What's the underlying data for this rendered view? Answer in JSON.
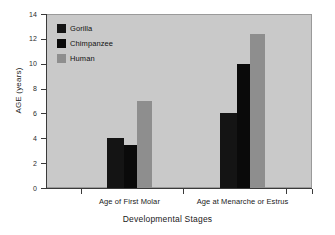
{
  "chart_data": {
    "type": "bar",
    "title": "",
    "xlabel": "Developmental Stages",
    "ylabel": "AGE (years)",
    "categories": [
      "Age of First Molar",
      "Age at Menarche or Estrus"
    ],
    "series": [
      {
        "name": "Gorilla",
        "color": "#141414",
        "values": [
          4.0,
          6.0
        ]
      },
      {
        "name": "Chimpanzee",
        "color": "#0a0a0a",
        "values": [
          3.45,
          10.0
        ]
      },
      {
        "name": "Human",
        "color": "#8e8e8e",
        "values": [
          7.0,
          12.4
        ]
      }
    ],
    "ylim": [
      0,
      14
    ],
    "yticks": [
      0,
      2,
      4,
      6,
      8,
      10,
      12,
      14
    ],
    "ytick_labels": [
      "0",
      "2",
      "4",
      "6",
      "8",
      "10",
      "12",
      "14"
    ],
    "grid": false,
    "legend_position": "top-left",
    "plot_background": "#c9c9c9",
    "figure_background": "#ffffff",
    "axis_color": "#3a3a3a"
  },
  "legend": {
    "items": [
      {
        "label": "Gorilla"
      },
      {
        "label": "Chimpanzee"
      },
      {
        "label": "Human"
      }
    ]
  }
}
